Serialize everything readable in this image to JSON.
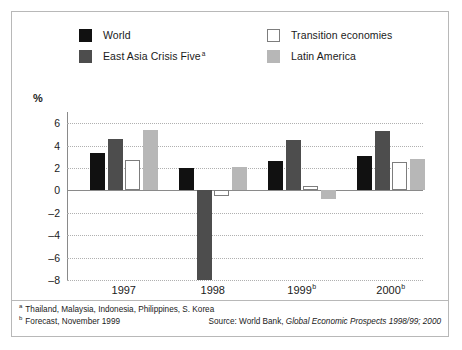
{
  "chart_data": {
    "type": "bar",
    "title": "",
    "xlabel": "",
    "ylabel": "%",
    "categories": [
      "1997",
      "1998",
      "1999",
      "2000"
    ],
    "category_labels": [
      {
        "text": "1997",
        "note": ""
      },
      {
        "text": "1998",
        "note": ""
      },
      {
        "text": "1999",
        "note": "b"
      },
      {
        "text": "2000",
        "note": "b"
      }
    ],
    "series": [
      {
        "name": "World",
        "color": "#111111",
        "values": [
          3.3,
          2.0,
          2.6,
          3.1
        ]
      },
      {
        "name": "East Asia Crisis Five",
        "color": "#4d4d4d",
        "values": [
          4.6,
          -8.0,
          4.5,
          5.3
        ]
      },
      {
        "name": "Transition economies",
        "color": "#ffffff",
        "values": [
          2.7,
          -0.5,
          0.4,
          2.5
        ]
      },
      {
        "name": "Latin America",
        "color": "#b7b7b7",
        "values": [
          5.4,
          2.1,
          -0.8,
          2.8
        ]
      }
    ],
    "ylim": [
      -8,
      7
    ],
    "yticks": [
      6,
      4,
      2,
      0,
      -2,
      -4,
      -6,
      -8
    ],
    "ytick_labels": [
      "6",
      "4",
      "2",
      "0",
      "–2",
      "–4",
      "–6",
      "–8"
    ],
    "grid": true,
    "legend_position": "top"
  },
  "legend": {
    "entries": [
      {
        "label": "World",
        "note": "",
        "series_index": 0
      },
      {
        "label": "East Asia Crisis Five",
        "note": "a",
        "series_index": 1
      },
      {
        "label": "Transition economies",
        "note": "",
        "series_index": 2
      },
      {
        "label": "Latin America",
        "note": "",
        "series_index": 3
      }
    ]
  },
  "axis": {
    "unit_label": "%"
  },
  "footnotes": [
    {
      "marker": "a",
      "text": "Thailand, Malaysia, Indonesia, Philippines, S. Korea"
    },
    {
      "marker": "b",
      "text": "Forecast, November 1999"
    }
  ],
  "source": {
    "prefix": "Source: World Bank,",
    "title": "Global Economic Prospects 1998/99; 2000"
  }
}
